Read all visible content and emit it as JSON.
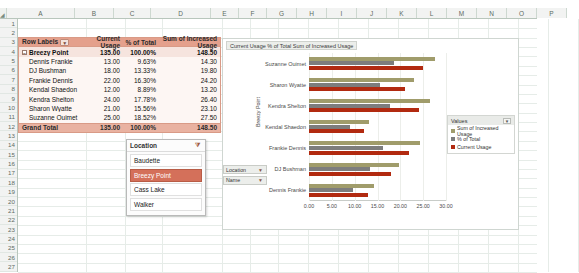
{
  "spreadsheet": {
    "columns": [
      "A",
      "B",
      "C",
      "D",
      "E",
      "F",
      "G",
      "H",
      "I",
      "J",
      "K",
      "L",
      "M",
      "N",
      "O",
      "P"
    ],
    "rows": [
      1,
      2,
      3,
      4,
      5,
      6,
      7,
      8,
      9,
      10,
      11,
      12,
      13,
      14,
      15,
      16,
      17,
      18,
      19,
      20,
      21,
      22,
      23,
      24,
      25,
      26,
      27
    ],
    "corner_icon": "select-all-icon"
  },
  "pivot": {
    "headers": [
      "Row Labels",
      "Current Usage",
      "% of Total",
      "Sum of Increased Usage"
    ],
    "filter_icon": "filter-icon",
    "expand_glyph": "-",
    "subtotal": {
      "label": "Breezy Point",
      "current_usage": "135.00",
      "pct_of_total": "100.00%",
      "increased_usage": "148.50"
    },
    "rows": [
      {
        "label": "Dennis Frankie",
        "current_usage": "13.00",
        "pct_of_total": "9.63%",
        "increased_usage": "14.30"
      },
      {
        "label": "DJ Bushman",
        "current_usage": "18.00",
        "pct_of_total": "13.33%",
        "increased_usage": "19.80"
      },
      {
        "label": "Frankie Dennis",
        "current_usage": "22.00",
        "pct_of_total": "16.30%",
        "increased_usage": "24.20"
      },
      {
        "label": "Kendal Shaedon",
        "current_usage": "12.00",
        "pct_of_total": "8.89%",
        "increased_usage": "13.20"
      },
      {
        "label": "Kendra Shelton",
        "current_usage": "24.00",
        "pct_of_total": "17.78%",
        "increased_usage": "26.40"
      },
      {
        "label": "Sharon Wyatte",
        "current_usage": "21.00",
        "pct_of_total": "15.56%",
        "increased_usage": "23.10"
      },
      {
        "label": "Suzanne Ouimet",
        "current_usage": "25.00",
        "pct_of_total": "18.52%",
        "increased_usage": "27.50"
      }
    ],
    "grand_total": {
      "label": "Grand Total",
      "current_usage": "135.00",
      "pct_of_total": "100.00%",
      "increased_usage": "148.50"
    }
  },
  "slicer": {
    "title": "Location",
    "clear_filter_icon": "clear-filter-icon",
    "items": [
      {
        "label": "Baudette",
        "selected": false
      },
      {
        "label": "Breezy Point",
        "selected": true
      },
      {
        "label": "Cass Lake",
        "selected": false
      },
      {
        "label": "Walker",
        "selected": false
      }
    ]
  },
  "chart_panel": {
    "title": "Current Usage  % of Total  Sum of Increased Usage",
    "filters": [
      {
        "label": "Location",
        "icon": "filter-funnel-icon"
      },
      {
        "label": "Name",
        "icon": "dropdown-icon"
      }
    ],
    "legend": {
      "title": "Values",
      "dropdown_icon": "chevron-down-icon",
      "entries": [
        {
          "label": "Sum of Increased Usage",
          "color": "#a09c6b"
        },
        {
          "label": "% of Total",
          "color": "#7d7d7d"
        },
        {
          "label": "Current Usage",
          "color": "#b22a10"
        }
      ]
    }
  },
  "chart_data": {
    "type": "bar",
    "orientation": "horizontal",
    "title": "Current Usage  % of Total  Sum of Increased Usage",
    "xlabel": "",
    "ylabel": "Breezy Point",
    "group_label": "Breezy Point",
    "categories": [
      "Suzanne Ouimet",
      "Sharon Wyatte",
      "Kendra Shelton",
      "Kendal Shaedon",
      "Frankie Dennis",
      "DJ Bushman",
      "Dennis Frankie"
    ],
    "series": [
      {
        "name": "Sum of Increased Usage",
        "color": "#a09c6b",
        "values": [
          27.5,
          23.1,
          26.4,
          13.2,
          24.2,
          19.8,
          14.3
        ]
      },
      {
        "name": "% of Total",
        "color": "#7d7d7d",
        "values": [
          0.1852,
          0.1556,
          0.1778,
          0.0889,
          0.163,
          0.1333,
          0.0963
        ]
      },
      {
        "name": "Current Usage",
        "color": "#b22a10",
        "values": [
          25.0,
          21.0,
          24.0,
          12.0,
          22.0,
          18.0,
          13.0
        ]
      }
    ],
    "xticks": [
      "0.00",
      "5.00",
      "10.00",
      "15.00",
      "20.00",
      "25.00",
      "30.00"
    ],
    "xlim": [
      0,
      30
    ],
    "grid": true,
    "legend_position": "right"
  }
}
